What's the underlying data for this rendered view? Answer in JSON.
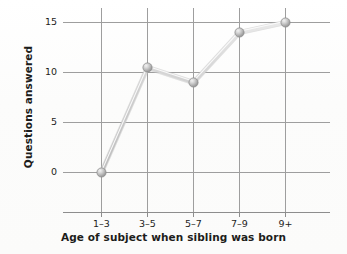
{
  "chart_data": {
    "type": "line",
    "title": "",
    "subtitle": "",
    "xlabel": "Age of subject when sibling was born",
    "ylabel": "Questions answered",
    "categories": [
      "1–3",
      "3–5",
      "5–7",
      "7–9",
      "9+"
    ],
    "values": [
      0,
      10.5,
      9,
      14,
      15
    ],
    "series": [
      {
        "name": "Questions answered",
        "values": [
          0,
          10.5,
          9,
          14,
          15
        ]
      }
    ],
    "ylim": [
      -4,
      16.5
    ],
    "yticks": [
      0,
      5,
      10,
      15
    ],
    "ytick_labels": [
      "0",
      "5",
      "10",
      "15"
    ],
    "xtick_labels": [
      "1–3",
      "3–5",
      "5–7",
      "7–9",
      "9+"
    ],
    "grid": true,
    "grid_axes": "both",
    "legend": false,
    "legend_position": "none",
    "marker": "sphere",
    "annotations": []
  },
  "style": {
    "background_color": "#fdfdfd",
    "grid_color": "#9a9a9a",
    "axis_color": "#8d8d8d",
    "line_color": "#d2d2d2",
    "line_highlight_color": "#efefef",
    "marker_fill": "#b8b8b8",
    "marker_edge": "#8f8f8f",
    "text_color": "#1d1d1b"
  }
}
